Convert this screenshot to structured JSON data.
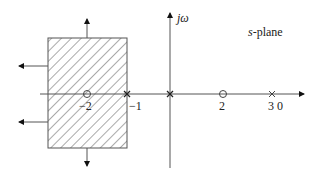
{
  "diagram": {
    "title": "s-plane",
    "axes": {
      "vertical_label": "jω",
      "horizontal_label": ""
    },
    "labels": {
      "neg_two": "−2",
      "neg_one": "−1",
      "two": "2",
      "three_zero": "3 0"
    },
    "poles": [
      {
        "value": -1,
        "marker": "x"
      },
      {
        "value": 0,
        "marker": "x"
      },
      {
        "value": 3,
        "marker": "x"
      }
    ],
    "zeros": [
      {
        "value": -2,
        "marker": "o"
      },
      {
        "value": 2,
        "marker": "o"
      }
    ],
    "region": {
      "description": "hatched rectangular region around -2, with outward arrows (up, down, left)",
      "fill": "diagonal hatch"
    },
    "colors": {
      "line": "#555555",
      "hatch": "#555555",
      "text": "#222222"
    }
  }
}
